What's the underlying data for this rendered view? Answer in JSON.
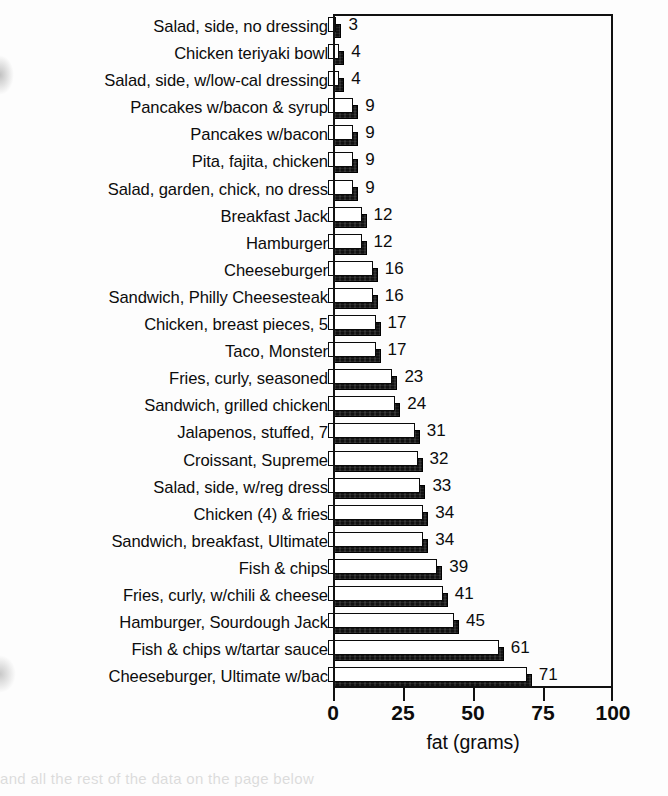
{
  "chart_data": {
    "type": "bar",
    "orientation": "horizontal",
    "title": "",
    "xlabel": "fat (grams)",
    "ylabel": "",
    "xlim": [
      0,
      100
    ],
    "xticks": [
      0,
      25,
      50,
      75,
      100
    ],
    "grid": false,
    "legend": null,
    "bar_style": "3d-shadowed",
    "categories": [
      "Salad, side, no dressing",
      "Chicken teriyaki bowl",
      "Salad, side, w/low-cal dressing",
      "Pancakes w/bacon & syrup",
      "Pancakes w/bacon",
      "Pita, fajita, chicken",
      "Salad, garden, chick, no dress",
      "Breakfast Jack",
      "Hamburger",
      "Cheeseburger",
      "Sandwich, Philly Cheesesteak",
      "Chicken, breast pieces, 5",
      "Taco, Monster",
      "Fries, curly, seasoned",
      "Sandwich, grilled chicken",
      "Jalapenos, stuffed, 7",
      "Croissant, Supreme",
      "Salad, side, w/reg dress",
      "Chicken (4) & fries",
      "Sandwich, breakfast, Ultimate",
      "Fish & chips",
      "Fries, curly, w/chili & cheese",
      "Hamburger, Sourdough Jack",
      "Fish & chips w/tartar sauce",
      "Cheeseburger, Ultimate w/bac"
    ],
    "values": [
      3,
      4,
      4,
      9,
      9,
      9,
      9,
      12,
      12,
      16,
      16,
      17,
      17,
      23,
      24,
      31,
      32,
      33,
      34,
      34,
      39,
      41,
      45,
      61,
      71
    ],
    "value_labels": [
      "3",
      "4",
      "4",
      "9",
      "9",
      "9",
      "9",
      "12",
      "12",
      "16",
      "16",
      "17",
      "17",
      "23",
      "24",
      "31",
      "32",
      "33",
      "34",
      "34",
      "39",
      "41",
      "45",
      "61",
      "71"
    ],
    "xtick_labels": [
      "0",
      "25",
      "50",
      "75",
      "100"
    ],
    "colors": {
      "bar_face": "#ffffff",
      "bar_outline": "#0a0a0a",
      "bar_shadow": "#111111",
      "text": "#0c0c0c",
      "frame": "#111111",
      "background": "#fdfdfd"
    }
  },
  "footer_ghost_text": "and all the rest of the data on the page below"
}
